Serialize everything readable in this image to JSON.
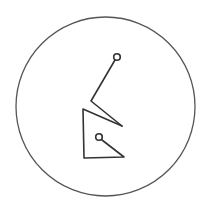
{
  "symbol": {
    "description": "Hand-drawn glyph enclosed in a circle",
    "stroke_color": "#3a3a3a",
    "background_color": "#ffffff",
    "outer_circle": {
      "cx": 105.5,
      "cy": 106.5,
      "r": 89.5
    },
    "upper_node": {
      "cx": 117,
      "cy": 57,
      "r": 3.5
    },
    "lower_node": {
      "cx": 99,
      "cy": 137,
      "r": 3.5
    }
  }
}
